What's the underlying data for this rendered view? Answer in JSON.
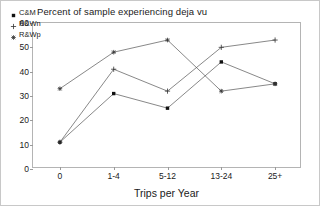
{
  "chart_data": {
    "type": "line",
    "title": "Percent of sample experiencing deja vu",
    "xlabel": "Trips per Year",
    "ylabel": "",
    "categories": [
      "0",
      "1-4",
      "5-12",
      "13-24",
      "25+"
    ],
    "ylim": [
      0,
      60
    ],
    "yticks": [
      0,
      10,
      20,
      30,
      40,
      50,
      60
    ],
    "grid": false,
    "legend_position": "top-left-inside",
    "series": [
      {
        "name": "C&M",
        "marker": "filled-square",
        "values": [
          11,
          31,
          25,
          44,
          35
        ]
      },
      {
        "name": "R&Wn",
        "marker": "plus",
        "values": [
          11,
          41,
          32,
          50,
          53
        ]
      },
      {
        "name": "R&Wp",
        "marker": "star",
        "values": [
          33,
          48,
          53,
          32,
          35
        ]
      }
    ]
  },
  "legend": {
    "items": [
      {
        "label": "C&M",
        "marker": "filled-square"
      },
      {
        "label": "R&Wn",
        "marker": "plus"
      },
      {
        "label": "R&Wp",
        "marker": "star"
      }
    ]
  },
  "colors": {
    "line": "#555555",
    "marker": "#111111",
    "frame": "#b4b4b4",
    "text": "#1a1a1a"
  }
}
